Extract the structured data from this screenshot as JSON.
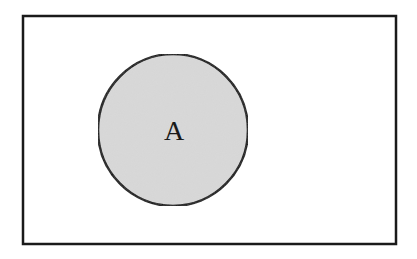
{
  "diagram": {
    "type": "venn",
    "universe": {
      "label": "",
      "x": 23,
      "y": 16,
      "width": 373,
      "height": 228,
      "stroke": "#1a1a1a",
      "fill": "#ffffff"
    },
    "sets": [
      {
        "label": "A",
        "cx": 173,
        "cy": 130,
        "rx": 75,
        "ry": 76,
        "fill": "#d9d9d9",
        "stroke": "#111111"
      }
    ]
  }
}
